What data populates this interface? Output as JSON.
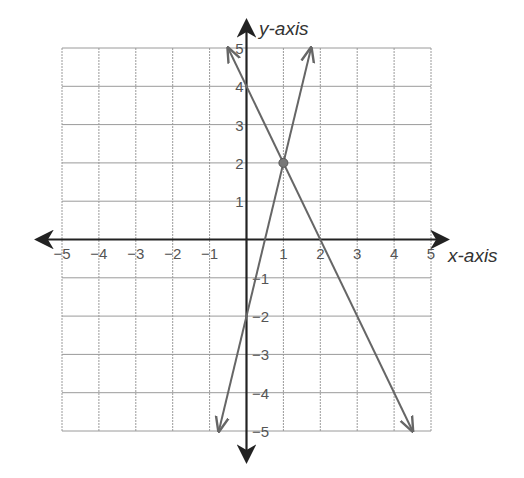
{
  "chart_data": {
    "type": "line",
    "title": "",
    "xlabel": "x-axis",
    "ylabel": "y-axis",
    "xlim": [
      -5,
      5
    ],
    "ylim": [
      -5,
      5
    ],
    "grid": true,
    "x_ticks": [
      -5,
      -4,
      -3,
      -2,
      -1,
      1,
      2,
      3,
      4,
      5
    ],
    "y_ticks": [
      -5,
      -4,
      -3,
      -2,
      -1,
      1,
      2,
      3,
      4,
      5
    ],
    "series": [
      {
        "name": "line-increasing",
        "equation": "y = 4x - 2",
        "slope": 4,
        "intercept": -2,
        "x": [
          -0.75,
          1.75
        ],
        "y": [
          -5,
          5
        ]
      },
      {
        "name": "line-decreasing",
        "equation": "y = -2x + 4",
        "slope": -2,
        "intercept": 4,
        "x": [
          -0.5,
          4.5
        ],
        "y": [
          5,
          -5
        ]
      }
    ],
    "annotations": [
      {
        "type": "point",
        "label": "intersection",
        "x": 1,
        "y": 2
      }
    ]
  },
  "labels": {
    "x_axis": "x-axis",
    "y_axis": "y-axis"
  },
  "colors": {
    "axis": "#222222",
    "grid": "#9a9a9a",
    "line": "#666666",
    "point": "#777777"
  }
}
